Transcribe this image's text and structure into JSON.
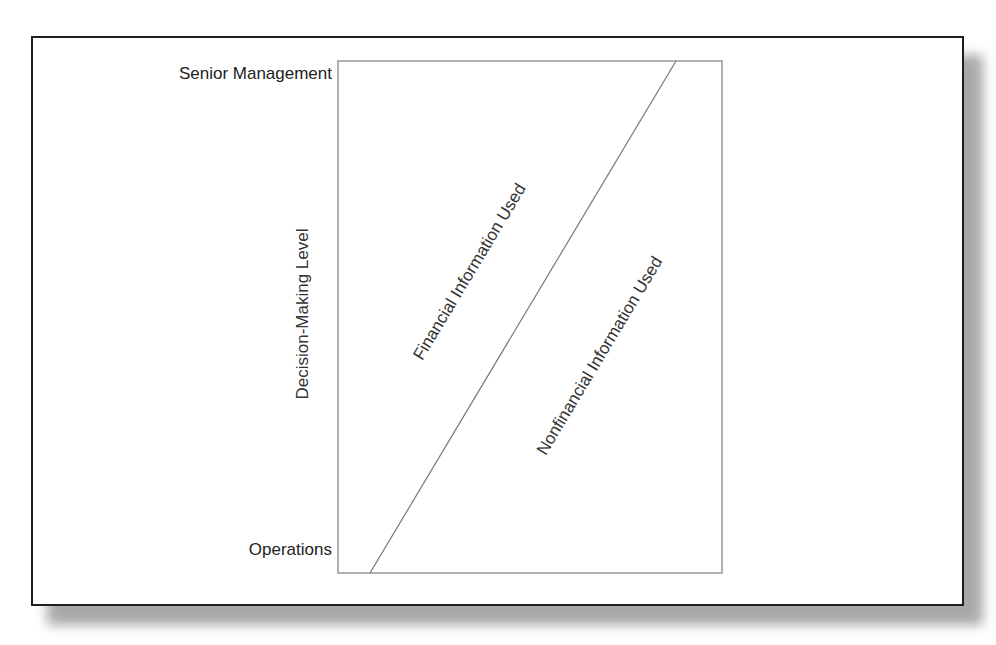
{
  "diagram": {
    "title": "",
    "y_axis": {
      "label": "Decision-Making Level",
      "top_label": "Senior Management",
      "bottom_label": "Operations"
    },
    "regions": [
      {
        "id": "upper-left",
        "label": "Financial Information Used"
      },
      {
        "id": "lower-right",
        "label": "Nonfinancial Information Used"
      }
    ],
    "divider": {
      "from": "bottom-left (Operations)",
      "to": "top-right (Senior Management)",
      "type": "diagonal line"
    },
    "colors": {
      "frame": "#1e1e1e",
      "box": "#888888",
      "line": "#777777",
      "text": "#222222",
      "shadow": "#a8a8a8"
    }
  }
}
